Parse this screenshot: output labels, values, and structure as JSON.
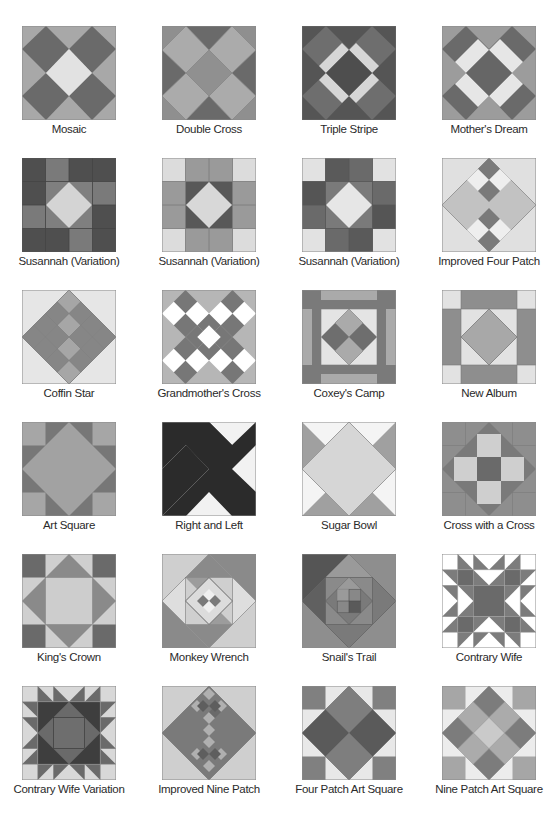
{
  "colors": {
    "light": "#e4e4e4",
    "white": "#ffffff",
    "medium_light": "#bdbdbd",
    "medium": "#9a9a9a",
    "medium_dark": "#7e7e7e",
    "dark": "#5f5f5f",
    "darkest": "#2b2b2b",
    "outline": "#8a8a8a"
  },
  "blocks": [
    {
      "name": "Mosaic"
    },
    {
      "name": "Double Cross"
    },
    {
      "name": "Triple Stripe"
    },
    {
      "name": "Mother's Dream"
    },
    {
      "name": "Susannah (Variation)"
    },
    {
      "name": "Susannah (Variation)"
    },
    {
      "name": "Susannah (Variation)"
    },
    {
      "name": "Improved Four Patch"
    },
    {
      "name": "Coffin Star"
    },
    {
      "name": "Grandmother's Cross"
    },
    {
      "name": "Coxey's Camp"
    },
    {
      "name": "New Album"
    },
    {
      "name": "Art Square"
    },
    {
      "name": "Right and Left"
    },
    {
      "name": "Sugar Bowl"
    },
    {
      "name": "Cross with a Cross"
    },
    {
      "name": "King's Crown"
    },
    {
      "name": "Monkey Wrench"
    },
    {
      "name": "Snail's Trail"
    },
    {
      "name": "Contrary Wife"
    },
    {
      "name": "Contrary Wife Variation"
    },
    {
      "name": "Improved Nine Patch"
    },
    {
      "name": "Four Patch Art Square"
    },
    {
      "name": "Nine Patch Art Square"
    }
  ]
}
